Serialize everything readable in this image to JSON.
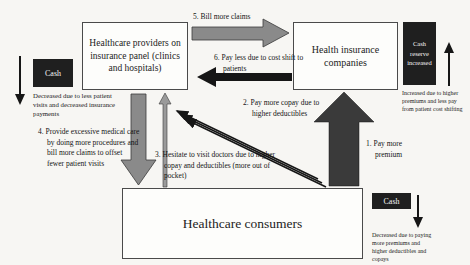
{
  "colors": {
    "bg": "#f7f6f3",
    "box-border": "#4a4a4a",
    "arrow-gray": "#8a8a8a",
    "arrow-gray-light": "#9a9a9a",
    "arrow-dark": "#3a3a3a",
    "arrow-black": "#161616",
    "cash-box": "#1f1f1f",
    "cash-text": "#f5f5f5"
  },
  "boxes": {
    "providers": {
      "title": "Healthcare providers on insurance panel (clinics and hospitals)"
    },
    "insurance": {
      "title": "Health insurance companies"
    },
    "consumers": {
      "title": "Healthcare consumers"
    }
  },
  "flows": {
    "pay_premium": {
      "num": "1.",
      "text": "Pay more premium"
    },
    "pay_copay": {
      "num": "2.",
      "text": "Pay more copay due to higher deductibles"
    },
    "hesitate": {
      "num": "3.",
      "text": "Hesitate to visit doctors due to higher copay and deductibles (more out of pocket)"
    },
    "excessive_care": {
      "num": "4.",
      "text": "Provide excessive medical care by doing more procedures and bill more claims to offset fewer patient visits"
    },
    "bill_claims": {
      "num": "5.",
      "text": "Bill more claims"
    },
    "pay_less": {
      "num": "6.",
      "text": "Pay less due to cost shift to patients"
    }
  },
  "cash": {
    "providers": {
      "label": "Cash",
      "note": "Decreased due to less patient visits and decreased insurance payments"
    },
    "insurance": {
      "label": "Cash reserve increased",
      "note": "Increased due to higher premiums and less pay from patient cost shifting"
    },
    "consumers": {
      "label": "Cash",
      "note": "Decreased due to paying more premiums and higher deductibles and copays"
    }
  }
}
